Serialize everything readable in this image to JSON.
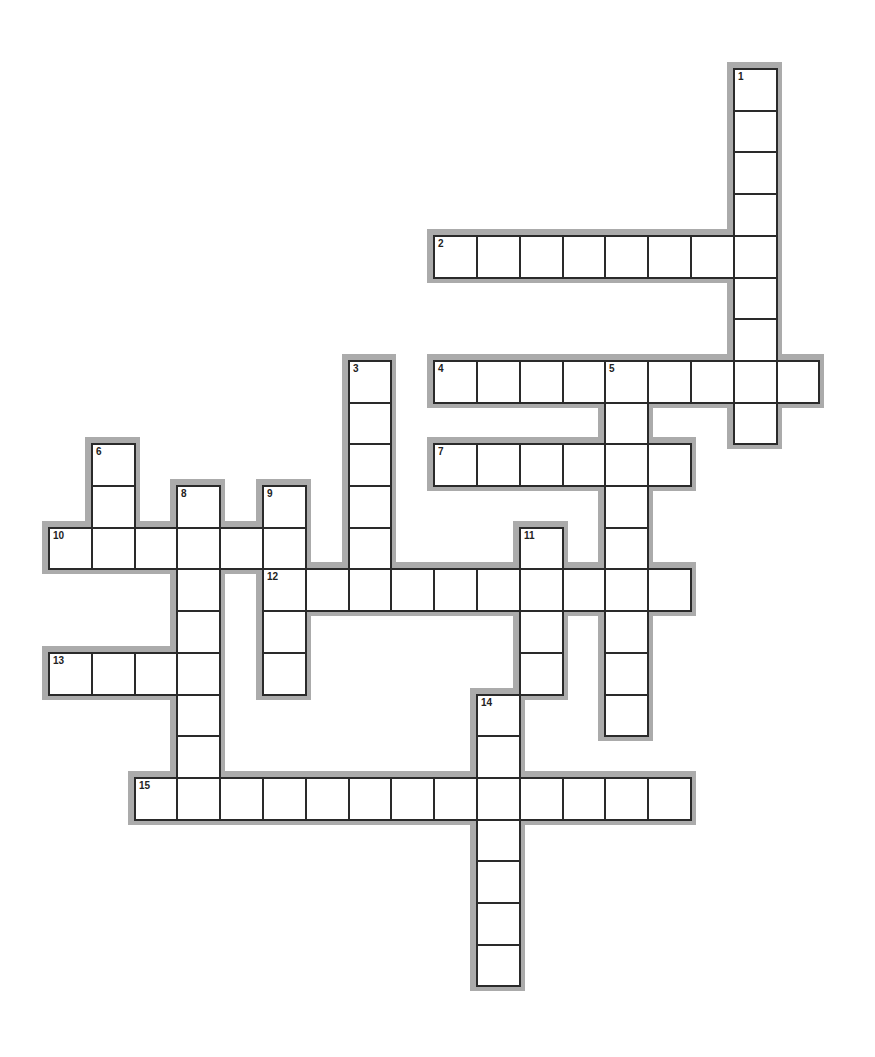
{
  "puzzle": {
    "type": "crossword",
    "grid": {
      "origin_x": 48,
      "origin_y": 68,
      "cell_w": 42.8,
      "cell_h": 41.7,
      "halo_px": 6,
      "colors": {
        "halo": "#ababab",
        "border": "#2a2a2a",
        "cell": "#ffffff"
      }
    },
    "words": [
      {
        "number": 1,
        "direction": "down",
        "row": 0,
        "col": 16,
        "length": 9
      },
      {
        "number": 2,
        "direction": "across",
        "row": 4,
        "col": 9,
        "length": 8
      },
      {
        "number": 3,
        "direction": "down",
        "row": 7,
        "col": 7,
        "length": 6
      },
      {
        "number": 4,
        "direction": "across",
        "row": 7,
        "col": 9,
        "length": 9
      },
      {
        "number": 5,
        "direction": "down",
        "row": 7,
        "col": 13,
        "length": 9
      },
      {
        "number": 6,
        "direction": "down",
        "row": 9,
        "col": 1,
        "length": 3
      },
      {
        "number": 7,
        "direction": "across",
        "row": 9,
        "col": 9,
        "length": 6
      },
      {
        "number": 8,
        "direction": "down",
        "row": 10,
        "col": 3,
        "length": 8
      },
      {
        "number": 9,
        "direction": "down",
        "row": 10,
        "col": 5,
        "length": 5
      },
      {
        "number": 10,
        "direction": "across",
        "row": 11,
        "col": 0,
        "length": 6
      },
      {
        "number": 11,
        "direction": "down",
        "row": 11,
        "col": 11,
        "length": 4
      },
      {
        "number": 12,
        "direction": "across",
        "row": 12,
        "col": 5,
        "length": 10
      },
      {
        "number": 13,
        "direction": "across",
        "row": 14,
        "col": 0,
        "length": 4
      },
      {
        "number": 14,
        "direction": "down",
        "row": 15,
        "col": 10,
        "length": 7
      },
      {
        "number": 15,
        "direction": "across",
        "row": 17,
        "col": 2,
        "length": 13
      }
    ]
  }
}
